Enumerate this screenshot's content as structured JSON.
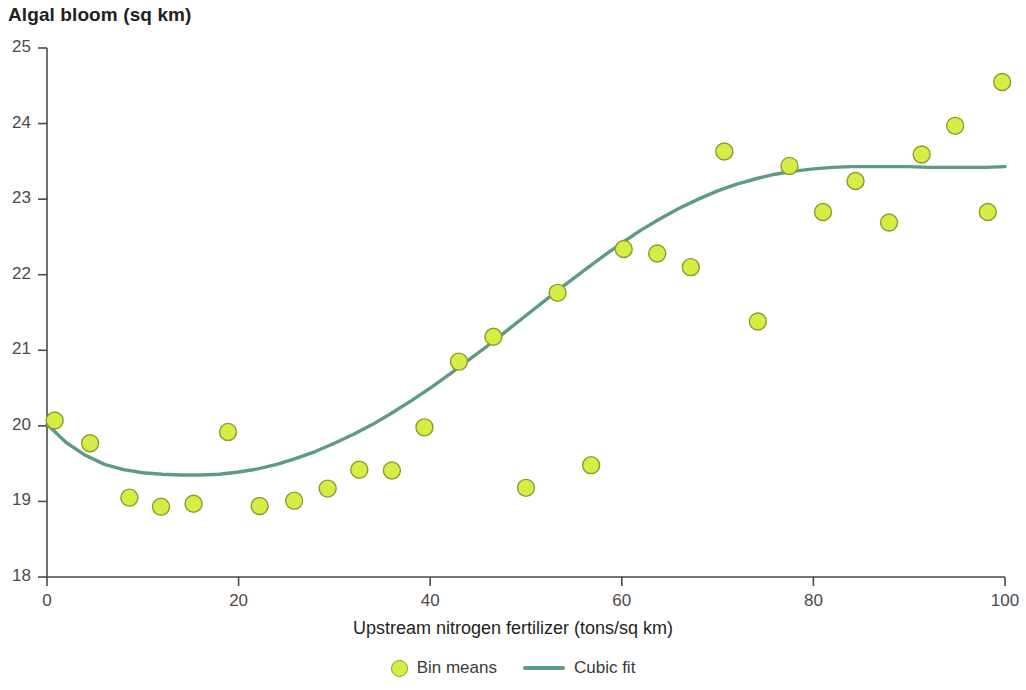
{
  "chart_data": {
    "type": "scatter",
    "title": "Algal bloom (sq km)",
    "xlabel": "Upstream nitrogen fertilizer (tons/sq km)",
    "ylabel": "Algal bloom (sq km)",
    "xlim": [
      0,
      100
    ],
    "ylim": [
      18,
      25
    ],
    "xticks": [
      0,
      20,
      40,
      60,
      80,
      100
    ],
    "yticks": [
      18,
      19,
      20,
      21,
      22,
      23,
      24,
      25
    ],
    "grid": false,
    "legend_position": "bottom-center",
    "colors": {
      "marker_fill": "#d7ec45",
      "marker_edge": "#8d9a2e",
      "line": "#5f9b7f",
      "axis": "#4a4a4a",
      "text": "#231f20"
    },
    "series": [
      {
        "name": "Bin means",
        "type": "scatter",
        "marker": "circle",
        "points": [
          [
            0.8,
            20.07
          ],
          [
            4.5,
            19.77
          ],
          [
            8.6,
            19.05
          ],
          [
            11.9,
            18.93
          ],
          [
            15.3,
            18.97
          ],
          [
            18.9,
            19.92
          ],
          [
            22.2,
            18.94
          ],
          [
            25.8,
            19.01
          ],
          [
            29.3,
            19.17
          ],
          [
            32.6,
            19.42
          ],
          [
            36.0,
            19.41
          ],
          [
            39.4,
            19.98
          ],
          [
            43.0,
            20.85
          ],
          [
            46.6,
            21.18
          ],
          [
            50.0,
            19.18
          ],
          [
            53.3,
            21.76
          ],
          [
            56.8,
            19.48
          ],
          [
            60.2,
            22.34
          ],
          [
            63.7,
            22.28
          ],
          [
            67.2,
            22.1
          ],
          [
            70.7,
            23.63
          ],
          [
            74.2,
            21.38
          ],
          [
            77.5,
            23.44
          ],
          [
            81.0,
            22.83
          ],
          [
            84.4,
            23.24
          ],
          [
            87.9,
            22.69
          ],
          [
            91.3,
            23.59
          ],
          [
            94.8,
            23.97
          ],
          [
            98.2,
            22.83
          ],
          [
            99.7,
            24.55
          ]
        ]
      },
      {
        "name": "Cubic fit",
        "type": "line",
        "points": [
          [
            0,
            20.02
          ],
          [
            2,
            19.78
          ],
          [
            4,
            19.61
          ],
          [
            6,
            19.49
          ],
          [
            8,
            19.42
          ],
          [
            10,
            19.38
          ],
          [
            12,
            19.36
          ],
          [
            14,
            19.35
          ],
          [
            16,
            19.35
          ],
          [
            18,
            19.36
          ],
          [
            20,
            19.39
          ],
          [
            22,
            19.43
          ],
          [
            24,
            19.49
          ],
          [
            26,
            19.57
          ],
          [
            28,
            19.66
          ],
          [
            30,
            19.77
          ],
          [
            32,
            19.89
          ],
          [
            34,
            20.02
          ],
          [
            36,
            20.17
          ],
          [
            38,
            20.33
          ],
          [
            40,
            20.5
          ],
          [
            42,
            20.68
          ],
          [
            44,
            20.87
          ],
          [
            46,
            21.06
          ],
          [
            48,
            21.26
          ],
          [
            50,
            21.46
          ],
          [
            52,
            21.66
          ],
          [
            54,
            21.86
          ],
          [
            56,
            22.05
          ],
          [
            58,
            22.24
          ],
          [
            60,
            22.42
          ],
          [
            62,
            22.59
          ],
          [
            64,
            22.74
          ],
          [
            66,
            22.88
          ],
          [
            68,
            23.0
          ],
          [
            70,
            23.11
          ],
          [
            72,
            23.2
          ],
          [
            74,
            23.27
          ],
          [
            76,
            23.33
          ],
          [
            78,
            23.37
          ],
          [
            80,
            23.4
          ],
          [
            82,
            23.42
          ],
          [
            84,
            23.43
          ],
          [
            86,
            23.43
          ],
          [
            88,
            23.43
          ],
          [
            90,
            23.43
          ],
          [
            92,
            23.42
          ],
          [
            94,
            23.42
          ],
          [
            96,
            23.42
          ],
          [
            98,
            23.42
          ],
          [
            100,
            23.43
          ]
        ]
      }
    ]
  },
  "legend": {
    "items": [
      {
        "label": "Bin means",
        "marker": "circle"
      },
      {
        "label": "Cubic fit",
        "marker": "line"
      }
    ]
  }
}
